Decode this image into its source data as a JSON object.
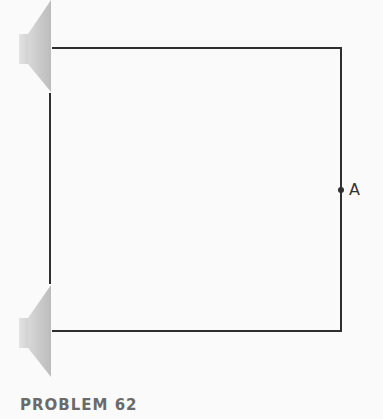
{
  "figure": {
    "caption": "PROBLEM 62",
    "point_label": "A",
    "colors": {
      "wire": "#2e2e2e",
      "speaker_cone": "#c4c4c4",
      "speaker_magnet": "#d6d6d6",
      "caption": "#6a6a6a",
      "background": "#fafafa"
    },
    "speakers": [
      {
        "name": "top-speaker",
        "position": "upper-left",
        "facing": "right"
      },
      {
        "name": "bottom-speaker",
        "position": "lower-left",
        "facing": "right"
      }
    ],
    "path": {
      "description": "rectangular path connecting the two speakers, point A on right side",
      "top_y": 48,
      "bottom_y": 331,
      "left_x": 51,
      "right_x": 341,
      "point_a_y": 190
    }
  }
}
